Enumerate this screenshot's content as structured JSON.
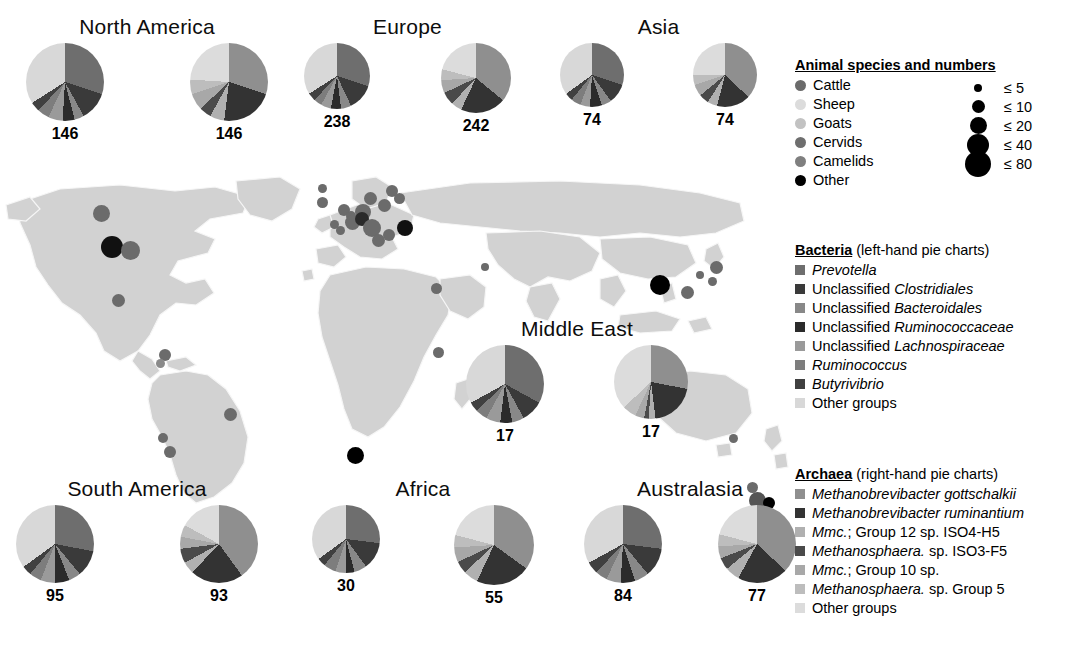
{
  "figure": {
    "type": "map-with-pie-charts"
  },
  "palette": {
    "bacteria": [
      "#6e6e6e",
      "#3a3a3a",
      "#888888",
      "#2b2b2b",
      "#9a9a9a",
      "#7d7d7d",
      "#404040",
      "#d8d8d8"
    ],
    "archaea": [
      "#8f8f8f",
      "#333333",
      "#b0b0b0",
      "#4a4a4a",
      "#a8a8a8",
      "#bdbdbd",
      "#dcdcdc"
    ],
    "animals": [
      "#6b6b6b",
      "#d5d5d5",
      "#bdbdbd",
      "#6e6e6e",
      "#808080",
      "#000000"
    ],
    "land": "#d2d2d2",
    "border": "#f4f4f4",
    "ocean": "#ffffff"
  },
  "legends": {
    "animals": {
      "title": "Animal species and numbers",
      "items": [
        {
          "label": "Cattle",
          "color": "#6b6b6b"
        },
        {
          "label": "Sheep",
          "color": "#dcdcdc"
        },
        {
          "label": "Goats",
          "color": "#c2c2c2"
        },
        {
          "label": "Cervids",
          "color": "#6e6e6e"
        },
        {
          "label": "Camelids",
          "color": "#7f7f7f"
        },
        {
          "label": "Other",
          "color": "#000000"
        }
      ],
      "sizes": [
        {
          "label": "≤  5",
          "diameter": 8
        },
        {
          "label": "≤ 10",
          "diameter": 13
        },
        {
          "label": "≤ 20",
          "diameter": 17
        },
        {
          "label": "≤ 40",
          "diameter": 22
        },
        {
          "label": "≤ 80",
          "diameter": 26
        }
      ]
    },
    "bacteria": {
      "title": "Bacteria",
      "subtitle": "(left-hand pie charts)",
      "items": [
        {
          "label": "Prevotella",
          "italic": true,
          "color": "#6e6e6e"
        },
        {
          "label": "Unclassified Clostridiales",
          "italic_tail": "Clostridiales",
          "color": "#3a3a3a"
        },
        {
          "label": "Unclassified Bacteroidales",
          "italic_tail": "Bacteroidales",
          "color": "#888888"
        },
        {
          "label": "Unclassified Ruminococcaceae",
          "italic_tail": "Ruminococcaceae",
          "color": "#2b2b2b"
        },
        {
          "label": "Unclassified Lachnospiraceae",
          "italic_tail": "Lachnospiraceae",
          "color": "#9a9a9a"
        },
        {
          "label": "Ruminococcus",
          "italic": true,
          "color": "#7d7d7d"
        },
        {
          "label": "Butyrivibrio",
          "italic": true,
          "color": "#404040"
        },
        {
          "label": "Other groups",
          "italic": false,
          "color": "#d8d8d8"
        }
      ]
    },
    "archaea": {
      "title": "Archaea",
      "subtitle": "(right-hand pie charts)",
      "items": [
        {
          "label": "Methanobrevibacter gottschalkii",
          "italic": true,
          "color": "#8f8f8f"
        },
        {
          "label": "Methanobrevibacter ruminantium",
          "italic": true,
          "color": "#333333"
        },
        {
          "label": "Mmc.; Group 12 sp. ISO4-H5",
          "italic_head": "Mmc.",
          "color": "#b0b0b0"
        },
        {
          "label": "Methanosphaera. sp. ISO3-F5",
          "italic_head": "Methanosphaera.",
          "color": "#4a4a4a"
        },
        {
          "label": "Mmc.; Group 10 sp.",
          "italic_head": "Mmc.",
          "color": "#a8a8a8"
        },
        {
          "label": "Methanosphaera. sp. Group 5",
          "italic_head": "Methanosphaera.",
          "color": "#bdbdbd"
        },
        {
          "label": "Other groups",
          "italic": false,
          "color": "#dcdcdc"
        }
      ]
    }
  },
  "chart_data": {
    "type": "pie",
    "legend_position": "right",
    "bacteria_categories": [
      "Prevotella",
      "Unclassified Clostridiales",
      "Unclassified Bacteroidales",
      "Unclassified Ruminococcaceae",
      "Unclassified Lachnospiraceae",
      "Ruminococcus",
      "Butyrivibrio",
      "Other groups"
    ],
    "archaea_categories": [
      "Methanobrevibacter gottschalkii",
      "Methanobrevibacter ruminantium",
      "Mmc.; Group 12 sp. ISO4-H5",
      "Methanosphaera. sp. ISO3-F5",
      "Mmc.; Group 10 sp.",
      "Methanosphaera. sp. Group 5",
      "Other groups"
    ],
    "regions": [
      {
        "name": "North America",
        "bacteria": {
          "count": "146",
          "values": [
            30,
            12,
            4,
            5,
            6,
            5,
            4,
            34
          ]
        },
        "archaea": {
          "count": "146",
          "values": [
            30,
            22,
            6,
            5,
            7,
            6,
            24
          ]
        }
      },
      {
        "name": "Europe",
        "bacteria": {
          "count": "238",
          "values": [
            30,
            13,
            5,
            5,
            5,
            4,
            4,
            34
          ]
        },
        "archaea": {
          "count": "242",
          "values": [
            36,
            21,
            5,
            6,
            6,
            5,
            21
          ]
        }
      },
      {
        "name": "Asia",
        "bacteria": {
          "count": "74",
          "values": [
            30,
            10,
            5,
            6,
            5,
            5,
            4,
            35
          ]
        },
        "archaea": {
          "count": "74",
          "values": [
            37,
            17,
            5,
            5,
            6,
            5,
            25
          ]
        }
      },
      {
        "name": "Middle East",
        "bacteria": {
          "count": "17",
          "values": [
            33,
            9,
            5,
            5,
            6,
            5,
            4,
            33
          ]
        },
        "archaea": {
          "count": "17",
          "values": [
            28,
            20,
            3,
            2,
            4,
            6,
            37
          ]
        }
      },
      {
        "name": "South America",
        "bacteria": {
          "count": "95",
          "values": [
            28,
            11,
            5,
            6,
            6,
            5,
            4,
            35
          ]
        },
        "archaea": {
          "count": "93",
          "values": [
            40,
            22,
            5,
            6,
            5,
            5,
            17
          ]
        }
      },
      {
        "name": "Africa",
        "bacteria": {
          "count": "30",
          "values": [
            27,
            13,
            6,
            4,
            5,
            6,
            4,
            35
          ]
        },
        "archaea": {
          "count": "55",
          "values": [
            35,
            22,
            6,
            5,
            6,
            5,
            21
          ]
        }
      },
      {
        "name": "Australasia",
        "bacteria": {
          "count": "84",
          "values": [
            27,
            12,
            6,
            6,
            6,
            5,
            5,
            33
          ]
        },
        "archaea": {
          "count": "77",
          "values": [
            37,
            21,
            6,
            5,
            5,
            5,
            21
          ]
        }
      }
    ]
  },
  "map_points": [
    {
      "x": 101,
      "y": 213,
      "d": 17,
      "c": "#6b6b6b"
    },
    {
      "x": 112,
      "y": 247,
      "d": 22,
      "c": "#111111"
    },
    {
      "x": 130,
      "y": 250,
      "d": 19,
      "c": "#6b6b6b"
    },
    {
      "x": 118,
      "y": 300,
      "d": 13,
      "c": "#6b6b6b"
    },
    {
      "x": 165,
      "y": 355,
      "d": 12,
      "c": "#6b6b6b"
    },
    {
      "x": 160,
      "y": 363,
      "d": 9,
      "c": "#8a8a8a"
    },
    {
      "x": 230,
      "y": 414,
      "d": 13,
      "c": "#6b6b6b"
    },
    {
      "x": 163,
      "y": 438,
      "d": 10,
      "c": "#6b6b6b"
    },
    {
      "x": 170,
      "y": 452,
      "d": 12,
      "c": "#6b6b6b"
    },
    {
      "x": 355,
      "y": 455,
      "d": 17,
      "c": "#000000"
    },
    {
      "x": 322,
      "y": 202,
      "d": 11,
      "c": "#6b6b6b"
    },
    {
      "x": 344,
      "y": 210,
      "d": 12,
      "c": "#6b6b6b"
    },
    {
      "x": 351,
      "y": 216,
      "d": 10,
      "c": "#6b6b6b"
    },
    {
      "x": 334,
      "y": 224,
      "d": 9,
      "c": "#6b6b6b"
    },
    {
      "x": 340,
      "y": 230,
      "d": 9,
      "c": "#6b6b6b"
    },
    {
      "x": 352,
      "y": 222,
      "d": 15,
      "c": "#6b6b6b"
    },
    {
      "x": 363,
      "y": 212,
      "d": 16,
      "c": "#6b6b6b"
    },
    {
      "x": 370,
      "y": 198,
      "d": 13,
      "c": "#6b6b6b"
    },
    {
      "x": 362,
      "y": 219,
      "d": 14,
      "c": "#2a2a2a"
    },
    {
      "x": 372,
      "y": 228,
      "d": 18,
      "c": "#6b6b6b"
    },
    {
      "x": 384,
      "y": 205,
      "d": 13,
      "c": "#6b6b6b"
    },
    {
      "x": 392,
      "y": 191,
      "d": 12,
      "c": "#6b6b6b"
    },
    {
      "x": 399,
      "y": 198,
      "d": 11,
      "c": "#6b6b6b"
    },
    {
      "x": 405,
      "y": 228,
      "d": 16,
      "c": "#111111"
    },
    {
      "x": 389,
      "y": 235,
      "d": 12,
      "c": "#6b6b6b"
    },
    {
      "x": 378,
      "y": 240,
      "d": 13,
      "c": "#6b6b6b"
    },
    {
      "x": 322,
      "y": 188,
      "d": 9,
      "c": "#6b6b6b"
    },
    {
      "x": 436,
      "y": 288,
      "d": 11,
      "c": "#6b6b6b"
    },
    {
      "x": 485,
      "y": 267,
      "d": 8,
      "c": "#6b6b6b"
    },
    {
      "x": 438,
      "y": 352,
      "d": 11,
      "c": "#6b6b6b"
    },
    {
      "x": 660,
      "y": 285,
      "d": 20,
      "c": "#000000"
    },
    {
      "x": 687,
      "y": 292,
      "d": 13,
      "c": "#6b6b6b"
    },
    {
      "x": 700,
      "y": 275,
      "d": 8,
      "c": "#6b6b6b"
    },
    {
      "x": 716,
      "y": 267,
      "d": 13,
      "c": "#6b6b6b"
    },
    {
      "x": 712,
      "y": 281,
      "d": 9,
      "c": "#6b6b6b"
    },
    {
      "x": 733,
      "y": 438,
      "d": 9,
      "c": "#6b6b6b"
    },
    {
      "x": 752,
      "y": 487,
      "d": 11,
      "c": "#6b6b6b"
    },
    {
      "x": 757,
      "y": 500,
      "d": 17,
      "c": "#555555"
    },
    {
      "x": 769,
      "y": 503,
      "d": 12,
      "c": "#000000"
    },
    {
      "x": 748,
      "y": 512,
      "d": 10,
      "c": "#c9c9c9"
    }
  ],
  "region_layout": [
    {
      "key": "north-america",
      "left": 22,
      "top": 16,
      "width": 250,
      "pie_d": [
        78,
        78
      ]
    },
    {
      "key": "europe",
      "left": 300,
      "top": 16,
      "width": 215,
      "pie_d": [
        66,
        70
      ]
    },
    {
      "key": "asia",
      "left": 556,
      "top": 16,
      "width": 205,
      "pie_d": [
        64,
        64
      ]
    },
    {
      "key": "middle-east",
      "left": 462,
      "top": 318,
      "width": 230,
      "pie_d": [
        78,
        74
      ]
    },
    {
      "key": "south-america",
      "left": 12,
      "top": 478,
      "width": 250,
      "pie_d": [
        78,
        78
      ]
    },
    {
      "key": "africa",
      "left": 308,
      "top": 478,
      "width": 230,
      "pie_d": [
        68,
        80
      ]
    },
    {
      "key": "australasia",
      "left": 580,
      "top": 478,
      "width": 220,
      "pie_d": [
        78,
        78
      ]
    }
  ]
}
